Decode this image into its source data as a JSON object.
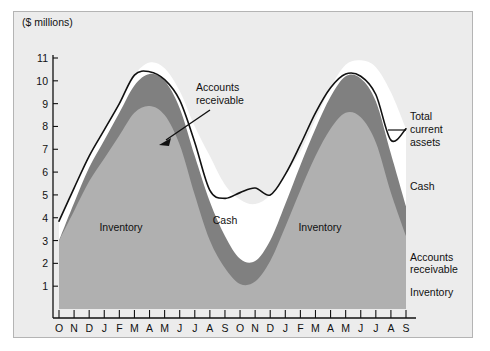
{
  "figure": {
    "background": "#ffffff",
    "panel_background": "#ececec",
    "panel_border": "#b4b4b4"
  },
  "chart_data": {
    "type": "area",
    "title": "",
    "subtitle": "",
    "xlabel": "",
    "ylabel": "",
    "axis_unit_label": "($ millions)",
    "ylim": [
      0,
      11.5
    ],
    "yticks": [
      1,
      2,
      3,
      4,
      5,
      6,
      7,
      8,
      9,
      10,
      11
    ],
    "ytick_labels": [
      "1",
      "2",
      "3",
      "4",
      "5",
      "6",
      "7",
      "8",
      "9",
      "10",
      "11"
    ],
    "grid": false,
    "legend_position": "right-outside",
    "stacked": true,
    "stack_order_bottom_to_top": [
      "Inventory",
      "Accounts receivable",
      "Cash"
    ],
    "categories": [
      "O",
      "N",
      "D",
      "J",
      "F",
      "M",
      "A",
      "M",
      "J",
      "J",
      "A",
      "S",
      "O",
      "N",
      "D",
      "J",
      "F",
      "M",
      "A",
      "M",
      "J",
      "J",
      "A",
      "S"
    ],
    "series": [
      {
        "name": "Inventory",
        "color": "#b0b0b0",
        "values": [
          3.0,
          4.3,
          5.6,
          6.6,
          7.6,
          8.6,
          8.9,
          8.5,
          7.2,
          5.0,
          3.0,
          1.8,
          1.1,
          1.2,
          2.1,
          3.6,
          5.2,
          6.7,
          7.9,
          8.6,
          8.4,
          7.3,
          5.1,
          3.2
        ]
      },
      {
        "name": "Accounts receivable",
        "color": "#808080",
        "values": [
          0.0,
          0.35,
          0.6,
          0.8,
          1.0,
          1.2,
          1.4,
          1.5,
          1.6,
          1.7,
          1.7,
          1.4,
          1.1,
          0.9,
          0.9,
          1.0,
          1.1,
          1.2,
          1.4,
          1.6,
          1.7,
          1.8,
          1.7,
          1.3
        ]
      },
      {
        "name": "Cash",
        "color": "#ffffff",
        "values": [
          0.85,
          0.65,
          0.5,
          0.45,
          0.4,
          0.45,
          0.5,
          0.55,
          0.75,
          1.3,
          2.0,
          2.25,
          2.6,
          2.5,
          2.0,
          1.3,
          0.6,
          0.4,
          0.4,
          0.5,
          0.8,
          1.5,
          2.7,
          3.4
        ]
      }
    ],
    "total_series": {
      "name": "Total current assets",
      "color": "#111111",
      "values": [
        3.85,
        5.3,
        6.7,
        7.85,
        9.0,
        10.25,
        10.4,
        10.05,
        9.15,
        7.3,
        5.2,
        4.85,
        5.1,
        5.3,
        5.0,
        5.9,
        7.2,
        8.6,
        9.7,
        10.3,
        10.2,
        9.4,
        7.4,
        7.9
      ]
    },
    "annotations": [
      {
        "name": "accounts-receivable-callout",
        "text_lines": [
          "Accounts",
          "receivable"
        ],
        "arrow": true
      },
      {
        "name": "total-current-assets-callout",
        "text_lines": [
          "Total",
          "current",
          "assets"
        ],
        "leader": true
      }
    ],
    "inline_labels": [
      {
        "name": "inventory-label-left",
        "text": "Inventory"
      },
      {
        "name": "cash-label-center",
        "text": "Cash"
      },
      {
        "name": "inventory-label-right",
        "text": "Inventory"
      }
    ],
    "right_labels": [
      {
        "name": "right-label-cash",
        "text": "Cash"
      },
      {
        "name": "right-label-accounts-receivable-1",
        "text": "Accounts"
      },
      {
        "name": "right-label-accounts-receivable-2",
        "text": "receivable"
      },
      {
        "name": "right-label-inventory",
        "text": "Inventory"
      }
    ],
    "callout_total": [
      "Total",
      "current",
      "assets"
    ],
    "callout_ar": [
      "Accounts",
      "receivable"
    ]
  }
}
